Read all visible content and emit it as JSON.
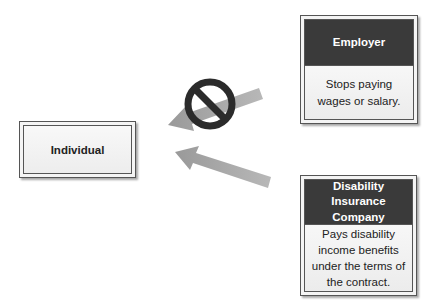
{
  "diagram": {
    "individual": {
      "label": "Individual"
    },
    "employer": {
      "title": "Employer",
      "description": "Stops paying wages or salary."
    },
    "insurer": {
      "title": "Disability Insurance Company",
      "description": "Pays disability income benefits under the terms of the contract."
    },
    "arrows": [
      {
        "from": "employer",
        "to": "individual",
        "blocked": true,
        "icon": "prohibited-icon"
      },
      {
        "from": "insurer",
        "to": "individual",
        "blocked": false
      }
    ],
    "colors": {
      "header": "#3a3a3a",
      "arrow": "#9a9a9a",
      "prohibited": "#2b2b2b"
    }
  }
}
